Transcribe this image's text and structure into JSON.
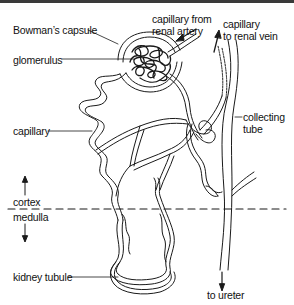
{
  "diagram": {
    "labels": {
      "bowmans_capsule": "Bowman’s capsule",
      "glomerulus": "glomerulus",
      "capillary_from_artery_1": "capillary from",
      "capillary_from_artery_2": "renal artery",
      "capillary_to_vein_1": "capillary",
      "capillary_to_vein_2": "to renal vein",
      "capillary": "capillary",
      "collecting_tube_1": "collecting",
      "collecting_tube_2": "tube",
      "cortex": "cortex",
      "medulla": "medulla",
      "kidney_tubule": "kidney tubule",
      "to_ureter": "to ureter"
    },
    "colors": {
      "ink": "#1a1a1a",
      "background": "#ffffff",
      "top_bar": "#3a3a3a"
    }
  }
}
